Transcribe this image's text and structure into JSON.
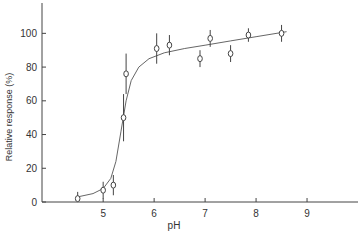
{
  "chart_data": {
    "type": "scatter",
    "title": "",
    "xlabel": "pH",
    "ylabel": "Relative response (%)",
    "xlim": [
      3.8,
      10.0
    ],
    "ylim": [
      0,
      118
    ],
    "xticks": [
      5,
      6,
      7,
      8,
      9
    ],
    "yticks": [
      0,
      20,
      40,
      60,
      80,
      100
    ],
    "grid": false,
    "legend": "none",
    "points": [
      {
        "x": 4.5,
        "y": 2,
        "err": 4
      },
      {
        "x": 5.0,
        "y": 7,
        "err": 5
      },
      {
        "x": 5.2,
        "y": 10,
        "err": 6
      },
      {
        "x": 5.4,
        "y": 50,
        "err": 14
      },
      {
        "x": 5.45,
        "y": 76,
        "err": 12
      },
      {
        "x": 6.05,
        "y": 91,
        "err": 9
      },
      {
        "x": 6.3,
        "y": 93,
        "err": 6
      },
      {
        "x": 6.9,
        "y": 85,
        "err": 5
      },
      {
        "x": 7.1,
        "y": 97,
        "err": 5
      },
      {
        "x": 7.5,
        "y": 88,
        "err": 5
      },
      {
        "x": 7.85,
        "y": 99,
        "err": 4
      },
      {
        "x": 8.5,
        "y": 100,
        "err": 5
      }
    ],
    "fit_curve": [
      [
        4.5,
        3
      ],
      [
        4.8,
        5
      ],
      [
        5.0,
        8
      ],
      [
        5.15,
        14
      ],
      [
        5.25,
        24
      ],
      [
        5.35,
        42
      ],
      [
        5.45,
        60
      ],
      [
        5.55,
        72
      ],
      [
        5.7,
        80
      ],
      [
        5.9,
        85
      ],
      [
        6.2,
        88.5
      ],
      [
        6.6,
        91
      ],
      [
        7.0,
        93
      ],
      [
        7.5,
        95.5
      ],
      [
        8.0,
        98
      ],
      [
        8.6,
        101
      ]
    ]
  }
}
